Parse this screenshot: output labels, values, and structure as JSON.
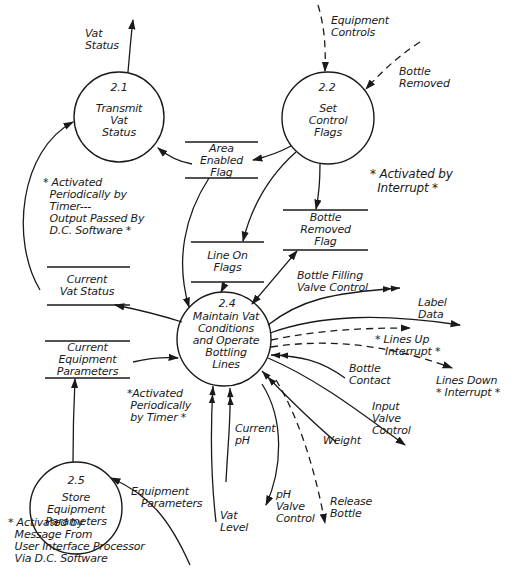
{
  "processes": [
    {
      "id": "2.1",
      "name": "Transmit\nVat\nStatus"
    },
    {
      "id": "2.2",
      "name": "Set\nControl\nFlags"
    },
    {
      "id": "2.4",
      "name": "Maintain Vat\nConditions\nand Operate\nBottling\nLines"
    },
    {
      "id": "2.5",
      "name": "Store\nEquipment\nParameters"
    }
  ],
  "data_stores": [
    {
      "name": "Area\nEnabled\nFlag"
    },
    {
      "name": "Bottle\nRemoved\nFlag"
    },
    {
      "name": "Line On\nFlags"
    },
    {
      "name": "Current\nVat Status"
    },
    {
      "name": "Current\nEquipment\nParameters"
    }
  ],
  "flows": {
    "vat_status": "Vat\nStatus",
    "equipment_controls": "Equipment\nControls",
    "bottle_removed": "Bottle\nRemoved",
    "bottle_filling_valve_control": "Bottle Filling\nValve Control",
    "label_data": "Label\nData",
    "lines_up_interrupt": "* Lines Up\n   Interrupt *",
    "bottle_contact": "Bottle\nContact",
    "lines_down_interrupt": "Lines Down\n* Interrupt *",
    "input_valve_control": "Input\nValve\nControl",
    "weight": "Weight",
    "current_ph": "Current\npH",
    "vat_level": "Vat\nLevel",
    "ph_valve_control": "pH\nValve\nControl",
    "release_bottle": "Release\nBottle",
    "equipment_parameters": "Equipment\n   Parameters"
  },
  "annotations": {
    "interrupt_22": "* Activated by\n  Interrupt *",
    "timer_21": "* Activated\n  Periodically by\n  Timer---\n  Output Passed By\n  D.C. Software *",
    "timer_24": "*Activated\n Periodically\n by Timer *",
    "message_25": "* Activated by\n  Message From\n  User Interface Processor\n  Via D.C. Software"
  }
}
